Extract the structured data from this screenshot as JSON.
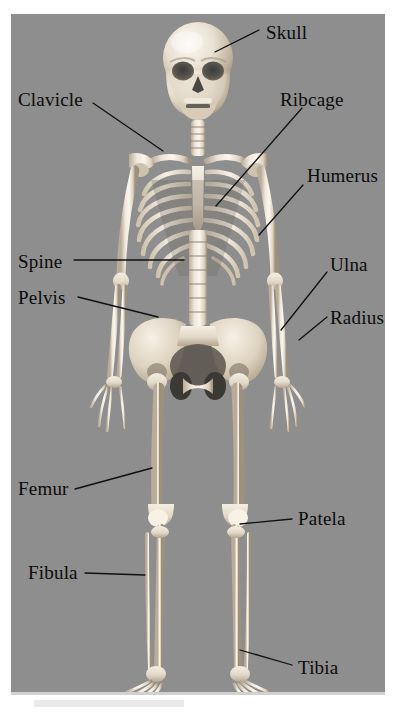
{
  "figure": {
    "kind": "anatomical-diagram",
    "panel_background_color": "#8e8e8e",
    "bone_color": "#e7ded0",
    "label_color": "#0b0b0b",
    "leader_line_color": "#111111"
  },
  "labels": [
    {
      "id": "skull",
      "text": "Skull",
      "side": "right",
      "x": 266,
      "y": 23,
      "anchor": "start"
    },
    {
      "id": "clavicle",
      "text": "Clavicle",
      "side": "left",
      "x": 18,
      "y": 90,
      "anchor": "start"
    },
    {
      "id": "ribcage",
      "text": "Ribcage",
      "side": "right",
      "x": 280,
      "y": 90,
      "anchor": "start"
    },
    {
      "id": "humerus",
      "text": "Humerus",
      "side": "right",
      "x": 307,
      "y": 166,
      "anchor": "start"
    },
    {
      "id": "spine",
      "text": "Spine",
      "side": "left",
      "x": 18,
      "y": 252,
      "anchor": "start"
    },
    {
      "id": "ulna",
      "text": "Ulna",
      "side": "right",
      "x": 330,
      "y": 255,
      "anchor": "start"
    },
    {
      "id": "pelvis",
      "text": "Pelvis",
      "side": "left",
      "x": 18,
      "y": 288,
      "anchor": "start"
    },
    {
      "id": "radius",
      "text": "Radius",
      "side": "right",
      "x": 330,
      "y": 308,
      "anchor": "start"
    },
    {
      "id": "femur",
      "text": "Femur",
      "side": "left",
      "x": 18,
      "y": 479,
      "anchor": "start"
    },
    {
      "id": "patela",
      "text": "Patela",
      "side": "right",
      "x": 298,
      "y": 509,
      "anchor": "start"
    },
    {
      "id": "fibula",
      "text": "Fibula",
      "side": "left",
      "x": 28,
      "y": 563,
      "anchor": "start"
    },
    {
      "id": "tibia",
      "text": "Tibia",
      "side": "right",
      "x": 298,
      "y": 658,
      "anchor": "start"
    }
  ],
  "leader_lines": [
    {
      "id": "skull-leader",
      "x1": 259,
      "y1": 30,
      "x2": 215,
      "y2": 52
    },
    {
      "id": "clavicle-leader",
      "x1": 93,
      "y1": 103,
      "x2": 163,
      "y2": 151
    },
    {
      "id": "ribcage-leader",
      "x1": 302,
      "y1": 108,
      "x2": 216,
      "y2": 206
    },
    {
      "id": "humerus-leader",
      "x1": 303,
      "y1": 185,
      "x2": 259,
      "y2": 235
    },
    {
      "id": "spine-leader",
      "x1": 74,
      "y1": 260,
      "x2": 184,
      "y2": 260
    },
    {
      "id": "ulna-leader",
      "x1": 327,
      "y1": 272,
      "x2": 281,
      "y2": 330
    },
    {
      "id": "pelvis-leader",
      "x1": 78,
      "y1": 297,
      "x2": 158,
      "y2": 317
    },
    {
      "id": "radius-leader",
      "x1": 327,
      "y1": 317,
      "x2": 299,
      "y2": 340
    },
    {
      "id": "femur-leader",
      "x1": 75,
      "y1": 489,
      "x2": 152,
      "y2": 468
    },
    {
      "id": "patela-leader",
      "x1": 292,
      "y1": 519,
      "x2": 240,
      "y2": 524
    },
    {
      "id": "fibula-leader",
      "x1": 85,
      "y1": 573,
      "x2": 145,
      "y2": 575
    },
    {
      "id": "tibia-leader",
      "x1": 292,
      "y1": 665,
      "x2": 240,
      "y2": 650
    }
  ]
}
